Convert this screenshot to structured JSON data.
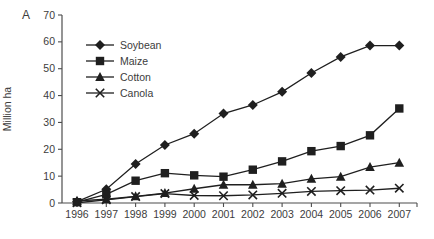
{
  "figure": {
    "panel_label": "A",
    "colors": {
      "background": "#ffffff",
      "series": "#1f1f1f",
      "axis": "#4d4d4d",
      "text": "#3c3c3c"
    }
  },
  "chart_data": {
    "type": "line",
    "title": "",
    "xlabel": "",
    "ylabel": "Million ha",
    "ylim": [
      0,
      70
    ],
    "y_ticks": [
      0,
      10,
      20,
      30,
      40,
      50,
      60,
      70
    ],
    "x": [
      1996,
      1997,
      1998,
      1999,
      2000,
      2001,
      2002,
      2003,
      2004,
      2005,
      2006,
      2007
    ],
    "grid": false,
    "legend_position": "upper-left-inside",
    "series": [
      {
        "name": "Soybean",
        "marker": "diamond",
        "values": [
          0.5,
          5.1,
          14.5,
          21.6,
          25.8,
          33.3,
          36.5,
          41.4,
          48.4,
          54.4,
          58.6,
          58.6
        ]
      },
      {
        "name": "Maize",
        "marker": "square",
        "values": [
          0.3,
          3.2,
          8.3,
          11.1,
          10.3,
          9.8,
          12.4,
          15.5,
          19.3,
          21.2,
          25.2,
          35.2
        ]
      },
      {
        "name": "Cotton",
        "marker": "triangle",
        "values": [
          0.8,
          1.4,
          2.5,
          3.7,
          5.3,
          6.8,
          6.8,
          7.2,
          9.0,
          9.8,
          13.4,
          15.0
        ]
      },
      {
        "name": "Canola",
        "marker": "x",
        "values": [
          0.1,
          1.2,
          2.4,
          3.5,
          2.8,
          2.7,
          3.0,
          3.6,
          4.3,
          4.6,
          4.8,
          5.5
        ]
      }
    ]
  }
}
